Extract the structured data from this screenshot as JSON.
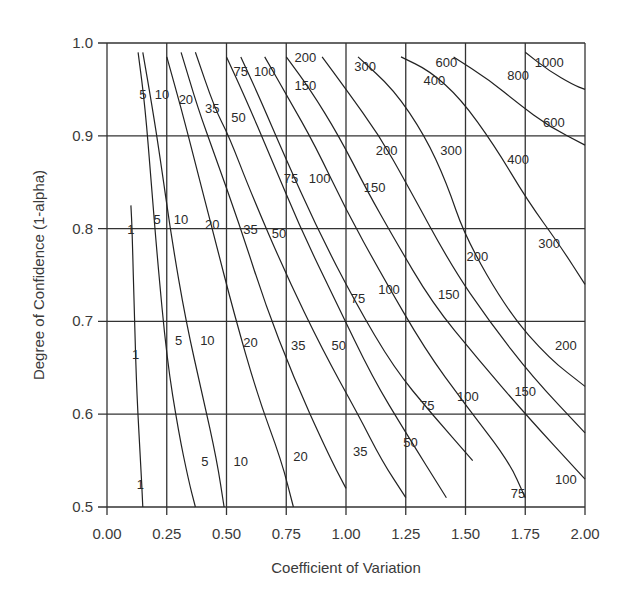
{
  "chart_data": {
    "type": "contour",
    "title": "",
    "xlabel": "Coefficient of Variation",
    "ylabel": "Degree of Confidence (1-alpha)",
    "xlim": [
      0.0,
      2.0
    ],
    "ylim": [
      0.5,
      1.0
    ],
    "xticks": [
      "0.00",
      "0.25",
      "0.50",
      "0.75",
      "1.00",
      "1.25",
      "1.50",
      "1.75",
      "2.00"
    ],
    "yticks": [
      "0.5",
      "0.6",
      "0.7",
      "0.8",
      "0.9",
      "1.0"
    ],
    "grid": true,
    "legend": "none",
    "contour_levels": [
      1,
      5,
      10,
      20,
      35,
      50,
      75,
      100,
      150,
      200,
      300,
      400,
      600,
      800,
      1000
    ],
    "series": [
      {
        "name": "1",
        "points": [
          [
            0.1,
            0.825
          ],
          [
            0.105,
            0.8
          ],
          [
            0.115,
            0.7
          ],
          [
            0.125,
            0.62
          ],
          [
            0.14,
            0.55
          ],
          [
            0.15,
            0.5
          ]
        ]
      },
      {
        "name": "5",
        "points": [
          [
            0.13,
            0.99
          ],
          [
            0.16,
            0.93
          ],
          [
            0.185,
            0.85
          ],
          [
            0.21,
            0.77
          ],
          [
            0.25,
            0.66
          ],
          [
            0.3,
            0.58
          ],
          [
            0.34,
            0.53
          ],
          [
            0.37,
            0.5
          ]
        ]
      },
      {
        "name": "10",
        "points": [
          [
            0.15,
            0.99
          ],
          [
            0.19,
            0.93
          ],
          [
            0.22,
            0.88
          ],
          [
            0.27,
            0.79
          ],
          [
            0.33,
            0.7
          ],
          [
            0.4,
            0.62
          ],
          [
            0.46,
            0.55
          ],
          [
            0.49,
            0.5
          ]
        ]
      },
      {
        "name": "20",
        "points": [
          [
            0.25,
            0.985
          ],
          [
            0.31,
            0.93
          ],
          [
            0.37,
            0.87
          ],
          [
            0.45,
            0.79
          ],
          [
            0.53,
            0.71
          ],
          [
            0.63,
            0.62
          ],
          [
            0.73,
            0.55
          ],
          [
            0.78,
            0.5
          ]
        ]
      },
      {
        "name": "35",
        "points": [
          [
            0.31,
            0.99
          ],
          [
            0.38,
            0.93
          ],
          [
            0.45,
            0.88
          ],
          [
            0.56,
            0.8
          ],
          [
            0.66,
            0.72
          ],
          [
            0.78,
            0.64
          ],
          [
            0.92,
            0.56
          ],
          [
            1.0,
            0.52
          ]
        ]
      },
      {
        "name": "50",
        "points": [
          [
            0.37,
            0.99
          ],
          [
            0.45,
            0.93
          ],
          [
            0.51,
            0.9
          ],
          [
            0.6,
            0.84
          ],
          [
            0.75,
            0.75
          ],
          [
            0.9,
            0.67
          ],
          [
            1.05,
            0.6
          ],
          [
            1.15,
            0.55
          ],
          [
            1.25,
            0.51
          ]
        ]
      },
      {
        "name": "75",
        "points": [
          [
            0.5,
            0.985
          ],
          [
            0.58,
            0.94
          ],
          [
            0.68,
            0.88
          ],
          [
            0.81,
            0.8
          ],
          [
            0.96,
            0.72
          ],
          [
            1.11,
            0.64
          ],
          [
            1.25,
            0.58
          ],
          [
            1.42,
            0.51
          ]
        ]
      },
      {
        "name": "100",
        "points": [
          [
            0.56,
            0.985
          ],
          [
            0.64,
            0.94
          ],
          [
            0.74,
            0.88
          ],
          [
            0.88,
            0.8
          ],
          [
            1.04,
            0.72
          ],
          [
            1.2,
            0.65
          ],
          [
            1.36,
            0.6
          ],
          [
            1.53,
            0.55
          ]
        ]
      },
      {
        "name": "150",
        "points": [
          [
            0.66,
            0.985
          ],
          [
            0.76,
            0.94
          ],
          [
            0.87,
            0.89
          ],
          [
            1.0,
            0.82
          ],
          [
            1.15,
            0.75
          ],
          [
            1.33,
            0.67
          ],
          [
            1.5,
            0.61
          ],
          [
            1.68,
            0.55
          ],
          [
            1.75,
            0.51
          ]
        ]
      },
      {
        "name": "200",
        "points": [
          [
            0.75,
            0.985
          ],
          [
            0.85,
            0.95
          ],
          [
            0.97,
            0.9
          ],
          [
            1.09,
            0.84
          ],
          [
            1.2,
            0.79
          ],
          [
            1.36,
            0.72
          ],
          [
            1.55,
            0.66
          ],
          [
            1.75,
            0.6
          ],
          [
            2.0,
            0.53
          ]
        ]
      },
      {
        "name": "300",
        "points": [
          [
            0.9,
            0.985
          ],
          [
            1.0,
            0.95
          ],
          [
            1.14,
            0.9
          ],
          [
            1.25,
            0.85
          ],
          [
            1.44,
            0.76
          ],
          [
            1.6,
            0.7
          ],
          [
            1.78,
            0.64
          ],
          [
            2.0,
            0.58
          ]
        ]
      },
      {
        "name": "400",
        "points": [
          [
            1.05,
            0.985
          ],
          [
            1.2,
            0.95
          ],
          [
            1.33,
            0.9
          ],
          [
            1.42,
            0.85
          ],
          [
            1.5,
            0.79
          ],
          [
            1.68,
            0.71
          ],
          [
            1.85,
            0.66
          ],
          [
            2.0,
            0.63
          ]
        ]
      },
      {
        "name": "600",
        "points": [
          [
            1.23,
            0.985
          ],
          [
            1.35,
            0.97
          ],
          [
            1.48,
            0.94
          ],
          [
            1.62,
            0.89
          ],
          [
            1.76,
            0.83
          ],
          [
            1.9,
            0.78
          ],
          [
            2.0,
            0.74
          ]
        ]
      },
      {
        "name": "800",
        "points": [
          [
            1.45,
            0.985
          ],
          [
            1.6,
            0.96
          ],
          [
            1.72,
            0.935
          ],
          [
            1.85,
            0.91
          ],
          [
            2.0,
            0.89
          ]
        ]
      },
      {
        "name": "1000",
        "points": [
          [
            1.75,
            0.99
          ],
          [
            1.85,
            0.97
          ],
          [
            1.95,
            0.955
          ],
          [
            2.0,
            0.95
          ]
        ]
      }
    ],
    "labels": [
      {
        "text": "5",
        "x": 0.15,
        "y": 0.945
      },
      {
        "text": "10",
        "x": 0.23,
        "y": 0.945
      },
      {
        "text": "20",
        "x": 0.33,
        "y": 0.94
      },
      {
        "text": "35",
        "x": 0.44,
        "y": 0.93
      },
      {
        "text": "50",
        "x": 0.55,
        "y": 0.92
      },
      {
        "text": "75",
        "x": 0.56,
        "y": 0.97
      },
      {
        "text": "100",
        "x": 0.66,
        "y": 0.97
      },
      {
        "text": "150",
        "x": 0.83,
        "y": 0.955
      },
      {
        "text": "200",
        "x": 0.83,
        "y": 0.985
      },
      {
        "text": "300",
        "x": 1.08,
        "y": 0.975
      },
      {
        "text": "400",
        "x": 1.37,
        "y": 0.96
      },
      {
        "text": "600",
        "x": 1.42,
        "y": 0.98
      },
      {
        "text": "800",
        "x": 1.72,
        "y": 0.965
      },
      {
        "text": "1000",
        "x": 1.85,
        "y": 0.98
      },
      {
        "text": "600",
        "x": 1.87,
        "y": 0.915
      },
      {
        "text": "200",
        "x": 1.17,
        "y": 0.885
      },
      {
        "text": "300",
        "x": 1.44,
        "y": 0.885
      },
      {
        "text": "400",
        "x": 1.72,
        "y": 0.875
      },
      {
        "text": "75",
        "x": 0.77,
        "y": 0.855
      },
      {
        "text": "100",
        "x": 0.89,
        "y": 0.855
      },
      {
        "text": "150",
        "x": 1.12,
        "y": 0.845
      },
      {
        "text": "5",
        "x": 0.21,
        "y": 0.81
      },
      {
        "text": "10",
        "x": 0.31,
        "y": 0.81
      },
      {
        "text": "20",
        "x": 0.44,
        "y": 0.805
      },
      {
        "text": "35",
        "x": 0.6,
        "y": 0.8
      },
      {
        "text": "50",
        "x": 0.72,
        "y": 0.795
      },
      {
        "text": "200",
        "x": 1.55,
        "y": 0.77
      },
      {
        "text": "300",
        "x": 1.85,
        "y": 0.785
      },
      {
        "text": "75",
        "x": 1.05,
        "y": 0.725
      },
      {
        "text": "100",
        "x": 1.18,
        "y": 0.735
      },
      {
        "text": "150",
        "x": 1.43,
        "y": 0.73
      },
      {
        "text": "5",
        "x": 0.3,
        "y": 0.68
      },
      {
        "text": "10",
        "x": 0.42,
        "y": 0.68
      },
      {
        "text": "20",
        "x": 0.6,
        "y": 0.678
      },
      {
        "text": "35",
        "x": 0.8,
        "y": 0.675
      },
      {
        "text": "50",
        "x": 0.97,
        "y": 0.675
      },
      {
        "text": "200",
        "x": 1.92,
        "y": 0.675
      },
      {
        "text": "75",
        "x": 1.34,
        "y": 0.61
      },
      {
        "text": "100",
        "x": 1.51,
        "y": 0.62
      },
      {
        "text": "150",
        "x": 1.75,
        "y": 0.625
      },
      {
        "text": "5",
        "x": 0.41,
        "y": 0.55
      },
      {
        "text": "10",
        "x": 0.56,
        "y": 0.55
      },
      {
        "text": "20",
        "x": 0.81,
        "y": 0.555
      },
      {
        "text": "35",
        "x": 1.06,
        "y": 0.56
      },
      {
        "text": "50",
        "x": 1.27,
        "y": 0.57
      },
      {
        "text": "75",
        "x": 1.72,
        "y": 0.515
      },
      {
        "text": "100",
        "x": 1.92,
        "y": 0.53
      },
      {
        "text": "1",
        "x": 0.1,
        "y": 0.8
      },
      {
        "text": "1",
        "x": 0.12,
        "y": 0.665
      },
      {
        "text": "1",
        "x": 0.14,
        "y": 0.525
      }
    ]
  }
}
